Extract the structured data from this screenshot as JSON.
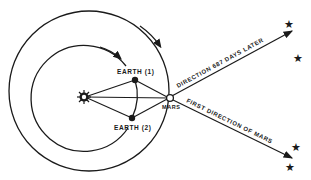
{
  "diagram": {
    "colors": {
      "ink": "#1a1a1a",
      "background": "#ffffff"
    },
    "bodies": {
      "sun": {
        "icon": "sun-icon"
      },
      "earth1": {
        "label": "EARTH (1)"
      },
      "earth2": {
        "label": "EARTH (2)"
      },
      "mars": {
        "label": "MARS"
      }
    },
    "orbits": {
      "inner": "Earth orbit",
      "outer": "Mars orbit"
    },
    "directions": {
      "later": "DIRECTION 687 DAYS LATER",
      "first": "FIRST DIRECTION OF MARS"
    },
    "stars": {
      "count": 4,
      "icon": "star-icon"
    }
  }
}
